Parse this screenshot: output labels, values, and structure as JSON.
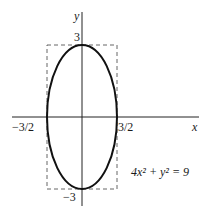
{
  "figure": {
    "equation": "4x² + y² = 9",
    "axes": {
      "x_label": "x",
      "y_label": "y"
    },
    "ticks": {
      "x_neg": "−3/2",
      "x_pos": "3/2",
      "y_pos": "3",
      "y_neg": "−3"
    },
    "ellipse": {
      "semi_axis_x": 1.5,
      "semi_axis_y": 3,
      "center": [
        0,
        0
      ]
    },
    "bounding_box": {
      "x_range": [
        -1.5,
        1.5
      ],
      "y_range": [
        -3,
        3
      ],
      "style": "dashed"
    },
    "colors": {
      "curve": "#111111",
      "axes": "#222222",
      "box": "#555555"
    }
  }
}
